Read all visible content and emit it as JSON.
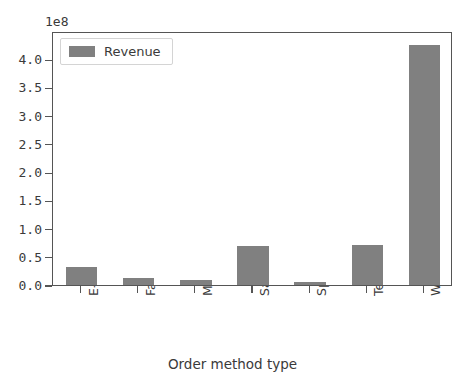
{
  "chart_data": {
    "type": "bar",
    "title": "",
    "subtitle": "",
    "xlabel": "Order method type",
    "ylabel": "",
    "y_offset_label": "1e8",
    "categories": [
      "E-mail",
      "Fax",
      "Mail",
      "Sales visit",
      "Special",
      "Telephone",
      "Web"
    ],
    "values": [
      32000000,
      13000000,
      8500000,
      70000000,
      5000000,
      71000000,
      425000000
    ],
    "values_scaled": [
      0.32,
      0.13,
      0.085,
      0.7,
      0.05,
      0.71,
      4.25
    ],
    "series": [
      {
        "name": "Revenue",
        "color": "#808080",
        "values": [
          32000000,
          13000000,
          8500000,
          70000000,
          5000000,
          71000000,
          425000000
        ]
      }
    ],
    "legend": {
      "position": "upper left",
      "entries": [
        {
          "label": "Revenue",
          "color": "#808080"
        }
      ]
    },
    "ylim": [
      0,
      450000000
    ],
    "ylim_scaled": [
      0.0,
      4.5
    ],
    "yticks_scaled": [
      0.0,
      0.5,
      1.0,
      1.5,
      2.0,
      2.5,
      3.0,
      3.5,
      4.0
    ],
    "ytick_labels": [
      "0.0",
      "0.5",
      "1.0",
      "1.5",
      "2.0",
      "2.5",
      "3.0",
      "3.5",
      "4.0"
    ],
    "xtick_labels": [
      "E-mail",
      "Fax",
      "Mail",
      "Sales visit",
      "Special",
      "Telephone",
      "Web"
    ],
    "xtick_rotation": 90,
    "grid": false,
    "bar_width_ratio": 0.55,
    "axes_color": "#555555",
    "text_color": "#3a3a3a",
    "background": "#ffffff"
  }
}
